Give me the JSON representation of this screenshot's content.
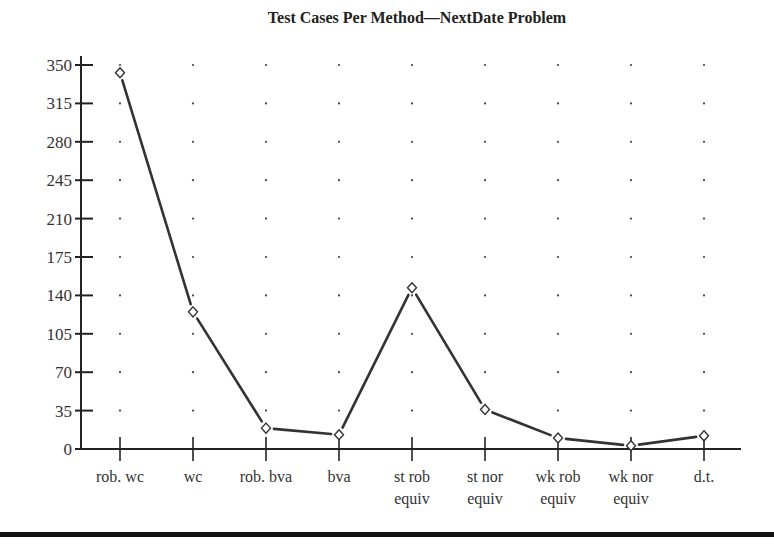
{
  "chart_data": {
    "type": "line",
    "title": "Test Cases Per Method—NextDate Problem",
    "xlabel": "",
    "ylabel": "",
    "categories": [
      "rob. wc",
      "wc",
      "rob. bva",
      "bva",
      "st rob equiv",
      "st nor equiv",
      "wk rob equiv",
      "wk nor equiv",
      "d.t."
    ],
    "category_lines": [
      [
        "rob. wc"
      ],
      [
        "wc"
      ],
      [
        "rob. bva"
      ],
      [
        "bva"
      ],
      [
        "st rob",
        "equiv"
      ],
      [
        "st nor",
        "equiv"
      ],
      [
        "wk rob",
        "equiv"
      ],
      [
        "wk nor",
        "equiv"
      ],
      [
        "d.t."
      ]
    ],
    "series": [
      {
        "name": "Test cases",
        "values": [
          343,
          125,
          19,
          13,
          147,
          36,
          10,
          3,
          12
        ],
        "marker": "diamond",
        "color": "#333333"
      }
    ],
    "yticks": [
      0,
      35,
      70,
      105,
      140,
      175,
      210,
      245,
      280,
      315,
      350
    ],
    "ylim": [
      0,
      350
    ],
    "grid": "dotted",
    "legend": "none"
  }
}
